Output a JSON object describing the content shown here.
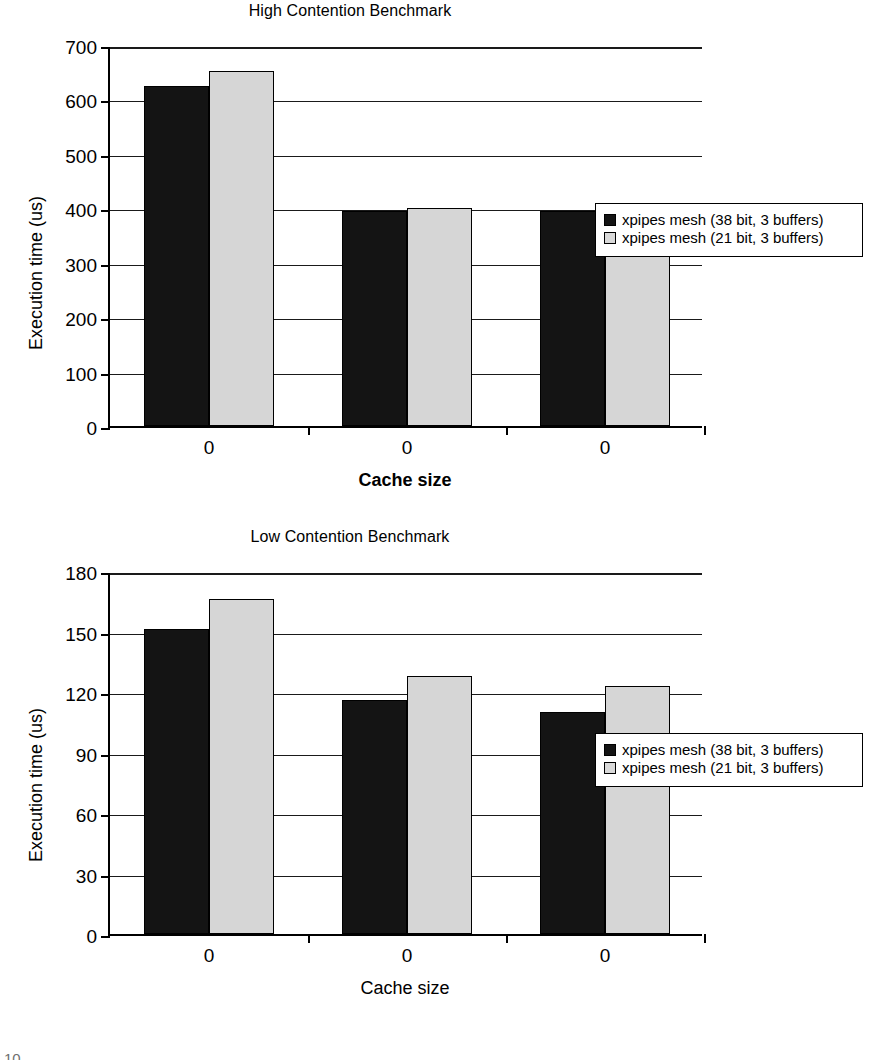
{
  "chart_data": [
    {
      "id": "high-contention",
      "type": "bar",
      "title": "High Contention Benchmark",
      "xlabel": "Cache size",
      "ylabel": "Execution time (us)",
      "categories": [
        "0",
        "0",
        "0"
      ],
      "ylim": [
        0,
        700
      ],
      "yticks": [
        0,
        100,
        200,
        300,
        400,
        500,
        600,
        700
      ],
      "grid": true,
      "legend_position": "right",
      "series": [
        {
          "name": "xpipes mesh (38 bit, 3 buffers)",
          "color": "#141414",
          "values": [
            625,
            395,
            395
          ]
        },
        {
          "name": "xpipes mesh (21 bit, 3 buffers)",
          "color": "#d6d6d6",
          "values": [
            652,
            400,
            400
          ]
        }
      ]
    },
    {
      "id": "low-contention",
      "type": "bar",
      "title": "Low Contention Benchmark",
      "xlabel": "Cache size",
      "ylabel": "Execution time (us)",
      "categories": [
        "0",
        "0",
        "0"
      ],
      "ylim": [
        0,
        180
      ],
      "yticks": [
        0,
        30,
        60,
        90,
        120,
        150,
        180
      ],
      "grid": true,
      "legend_position": "right",
      "series": [
        {
          "name": "xpipes mesh (38 bit, 3 buffers)",
          "color": "#141414",
          "values": [
            151,
            116,
            110
          ]
        },
        {
          "name": "xpipes mesh (21 bit, 3 buffers)",
          "color": "#d6d6d6",
          "values": [
            166,
            128,
            123
          ]
        }
      ]
    }
  ],
  "page_artifact": "10"
}
